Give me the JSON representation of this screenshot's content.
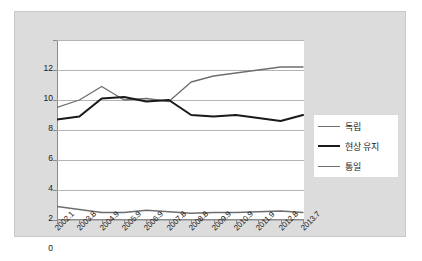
{
  "chart_data": {
    "type": "line",
    "title": "",
    "xlabel": "",
    "ylabel": "",
    "ylim": [
      0,
      12
    ],
    "ytick_values": [
      12,
      10,
      8,
      6,
      4,
      2,
      0
    ],
    "ytick_labels": [
      "12",
      "10",
      "8",
      "6",
      "4",
      "2",
      "0"
    ],
    "grid": true,
    "legend_position": "right",
    "categories": [
      "2002.1",
      "2003.8",
      "2004.9",
      "2005.9",
      "2006.9",
      "2007.8",
      "2008.8",
      "2009.9",
      "2010.9",
      "2011.9",
      "2012.8",
      "2013.7"
    ],
    "series": [
      {
        "name": "독립",
        "color": "#6e6e6e",
        "width": 1.3,
        "values": [
          7.5,
          8.0,
          8.9,
          8.0,
          8.1,
          7.9,
          9.2,
          9.6,
          9.8,
          10.0,
          10.2,
          10.2
        ]
      },
      {
        "name": "현상 유지",
        "color": "#1a1a1a",
        "width": 2.1,
        "values": [
          6.7,
          6.9,
          8.1,
          8.2,
          7.9,
          8.0,
          7.0,
          6.9,
          7.0,
          6.8,
          6.6,
          7.0
        ]
      },
      {
        "name": "통일",
        "color": "#6e6e6e",
        "width": 1.3,
        "values": [
          0.9,
          0.7,
          0.5,
          0.5,
          0.65,
          0.55,
          0.45,
          0.5,
          0.5,
          0.55,
          0.6,
          0.5
        ]
      }
    ]
  },
  "legend": {
    "items": [
      {
        "label": "독립"
      },
      {
        "label": "현상 유지"
      },
      {
        "label": "통일"
      }
    ]
  }
}
